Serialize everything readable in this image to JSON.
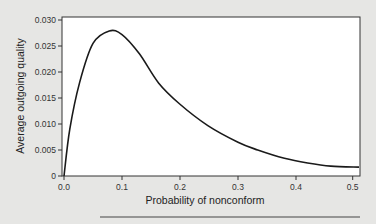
{
  "chart_data": {
    "type": "line",
    "title": "",
    "xlabel": "Probability of nonconform",
    "ylabel": "Average outgoing quality",
    "xlim": [
      0,
      0.51
    ],
    "ylim": [
      0,
      0.03
    ],
    "xticks": [
      "0.0",
      "0.1",
      "0.2",
      "0.3",
      "0.4",
      "0.5"
    ],
    "yticks": [
      "0",
      "0.005",
      "0.010",
      "0.015",
      "0.020",
      "0.025",
      "0.030"
    ],
    "grid": false,
    "legend": null,
    "series": [
      {
        "name": "AOQ",
        "x": [
          0.0,
          0.01,
          0.027,
          0.05,
          0.078,
          0.1,
          0.13,
          0.163,
          0.2,
          0.248,
          0.3,
          0.334,
          0.38,
          0.42,
          0.46,
          0.51
        ],
        "y": [
          0.0,
          0.009,
          0.018,
          0.0255,
          0.0279,
          0.0272,
          0.0235,
          0.0179,
          0.0138,
          0.0097,
          0.0065,
          0.005,
          0.0034,
          0.0025,
          0.0019,
          0.0017
        ]
      }
    ]
  }
}
